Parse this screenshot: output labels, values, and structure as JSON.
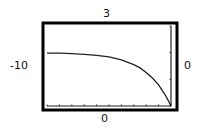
{
  "chart_data": {
    "type": "line",
    "title": "",
    "xlabel": "",
    "ylabel": "",
    "xlim": [
      -10,
      0
    ],
    "ylim": [
      0,
      3
    ],
    "window_labels": {
      "xmin": "-10",
      "xmax": "0",
      "ymin": "0",
      "ymax": "3"
    },
    "x_tick_step": 1,
    "y_tick_step": 1,
    "grid": false,
    "series": [
      {
        "name": "curve",
        "x": [
          -10,
          -9,
          -8,
          -7,
          -6,
          -5,
          -4,
          -3,
          -2.5,
          -2,
          -1.5,
          -1,
          -0.5,
          -0.25,
          0
        ],
        "y": [
          1.98,
          1.98,
          1.96,
          1.94,
          1.9,
          1.84,
          1.73,
          1.55,
          1.43,
          1.26,
          1.05,
          0.79,
          0.44,
          0.23,
          0
        ]
      }
    ]
  },
  "colors": {
    "frame": "#000000",
    "curve": "#222222",
    "axes": "#222222",
    "background": "#ffffff"
  }
}
